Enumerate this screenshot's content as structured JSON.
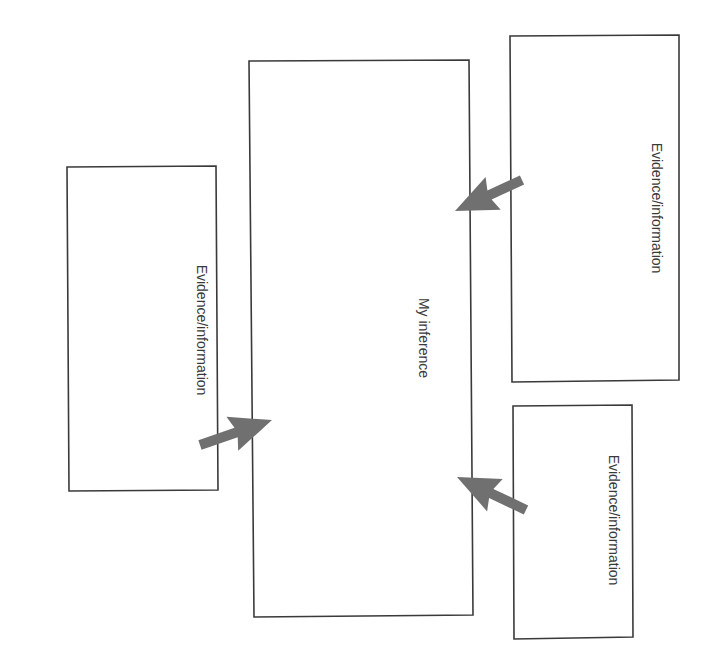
{
  "diagram": {
    "title": "",
    "center_box": {
      "label": "My inference"
    },
    "evidence_boxes": [
      {
        "id": "left",
        "label": "Evidence/information"
      },
      {
        "id": "top-right",
        "label": "Evidence/information"
      },
      {
        "id": "bottom-right",
        "label": "Evidence/information"
      }
    ],
    "arrows": [
      {
        "from": "left",
        "to": "center_box"
      },
      {
        "from": "top-right",
        "to": "center_box"
      },
      {
        "from": "bottom-right",
        "to": "center_box"
      }
    ],
    "colors": {
      "stroke": "#3a3a3a",
      "arrow": "#707070",
      "background": "#ffffff"
    }
  }
}
